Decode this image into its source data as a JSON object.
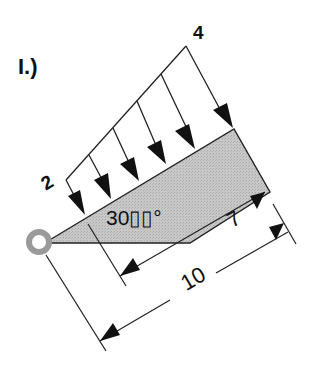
{
  "figure": {
    "part_label": "I.)",
    "load": {
      "left_value": "2",
      "right_value": "4",
      "arrow_count": 6
    },
    "angle_label": "30▯▯°",
    "dimensions": {
      "inner": "7",
      "outer": "10"
    },
    "colors": {
      "beam_fill": "#c4c4c4",
      "support_ring": "#9a9a9a",
      "line": "#1a1a1a"
    }
  }
}
